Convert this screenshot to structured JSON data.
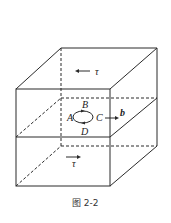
{
  "figure": {
    "caption": "图 2-2",
    "labels": {
      "tau_top": "τ",
      "tau_bottom": "τ",
      "A": "A",
      "B": "B",
      "C": "C",
      "D": "D",
      "b": "b"
    },
    "colors": {
      "line": "#2a2a2a",
      "background": "#ffffff"
    }
  }
}
